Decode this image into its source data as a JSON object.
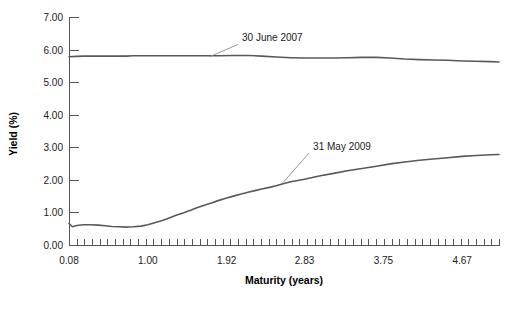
{
  "chart_data": {
    "type": "line",
    "title": "",
    "xlabel": "Maturity (years)",
    "ylabel": "Yield (%)",
    "xlim": [
      0.08,
      5.1
    ],
    "ylim": [
      0.0,
      7.0
    ],
    "grid": false,
    "legend_position": "inline-annotations",
    "x_tick_labels": [
      "0.08",
      "1.00",
      "1.92",
      "2.83",
      "3.75",
      "4.67"
    ],
    "x_tick_values": [
      0.08,
      1.0,
      1.92,
      2.83,
      3.75,
      4.67
    ],
    "y_tick_labels": [
      "0.00",
      "1.00",
      "2.00",
      "3.00",
      "4.00",
      "5.00",
      "6.00",
      "7.00"
    ],
    "y_tick_values": [
      0,
      1,
      2,
      3,
      4,
      5,
      6,
      7
    ],
    "x_minor_tick_count": 56,
    "series": [
      {
        "name": "30 June 2007",
        "color": "#595959",
        "annotation": {
          "label": "30 June 2007",
          "label_x": 2.1,
          "label_y": 6.25,
          "anchor_x": 1.72,
          "anchor_y": 5.78
        },
        "x": [
          0.08,
          0.17,
          0.25,
          0.33,
          0.42,
          0.5,
          0.58,
          0.67,
          0.75,
          0.83,
          0.92,
          1.0,
          1.17,
          1.33,
          1.5,
          1.67,
          1.83,
          2.0,
          2.17,
          2.33,
          2.5,
          2.67,
          2.83,
          3.0,
          3.17,
          3.33,
          3.5,
          3.67,
          3.83,
          4.0,
          4.17,
          4.33,
          4.5,
          4.67,
          4.83,
          5.0,
          5.1
        ],
        "values": [
          5.78,
          5.79,
          5.8,
          5.8,
          5.8,
          5.8,
          5.8,
          5.8,
          5.8,
          5.81,
          5.81,
          5.81,
          5.81,
          5.81,
          5.81,
          5.81,
          5.81,
          5.82,
          5.82,
          5.8,
          5.77,
          5.75,
          5.74,
          5.74,
          5.74,
          5.75,
          5.76,
          5.76,
          5.74,
          5.71,
          5.69,
          5.68,
          5.67,
          5.65,
          5.64,
          5.63,
          5.62
        ]
      },
      {
        "name": "31 May 2009",
        "color": "#595959",
        "annotation": {
          "label": "31 May 2009",
          "label_x": 2.93,
          "label_y": 2.92,
          "anchor_x": 2.58,
          "anchor_y": 1.92
        },
        "x": [
          0.08,
          0.12,
          0.17,
          0.25,
          0.33,
          0.42,
          0.5,
          0.58,
          0.67,
          0.75,
          0.83,
          0.92,
          1.0,
          1.08,
          1.17,
          1.25,
          1.33,
          1.42,
          1.5,
          1.58,
          1.67,
          1.75,
          1.83,
          1.92,
          2.0,
          2.08,
          2.17,
          2.25,
          2.33,
          2.42,
          2.5,
          2.58,
          2.67,
          2.75,
          2.83,
          2.92,
          3.0,
          3.17,
          3.33,
          3.5,
          3.67,
          3.83,
          4.0,
          4.17,
          4.33,
          4.5,
          4.67,
          4.83,
          5.0,
          5.1
        ],
        "values": [
          0.66,
          0.56,
          0.6,
          0.62,
          0.62,
          0.61,
          0.59,
          0.57,
          0.56,
          0.55,
          0.56,
          0.58,
          0.62,
          0.68,
          0.75,
          0.83,
          0.91,
          0.99,
          1.07,
          1.15,
          1.23,
          1.3,
          1.37,
          1.44,
          1.5,
          1.56,
          1.62,
          1.67,
          1.72,
          1.77,
          1.82,
          1.88,
          1.94,
          1.98,
          2.02,
          2.07,
          2.12,
          2.2,
          2.28,
          2.35,
          2.42,
          2.49,
          2.55,
          2.6,
          2.64,
          2.68,
          2.72,
          2.75,
          2.77,
          2.78
        ]
      }
    ]
  },
  "plot_geometry": {
    "left": 69,
    "right": 499,
    "top": 17,
    "bottom": 245
  }
}
